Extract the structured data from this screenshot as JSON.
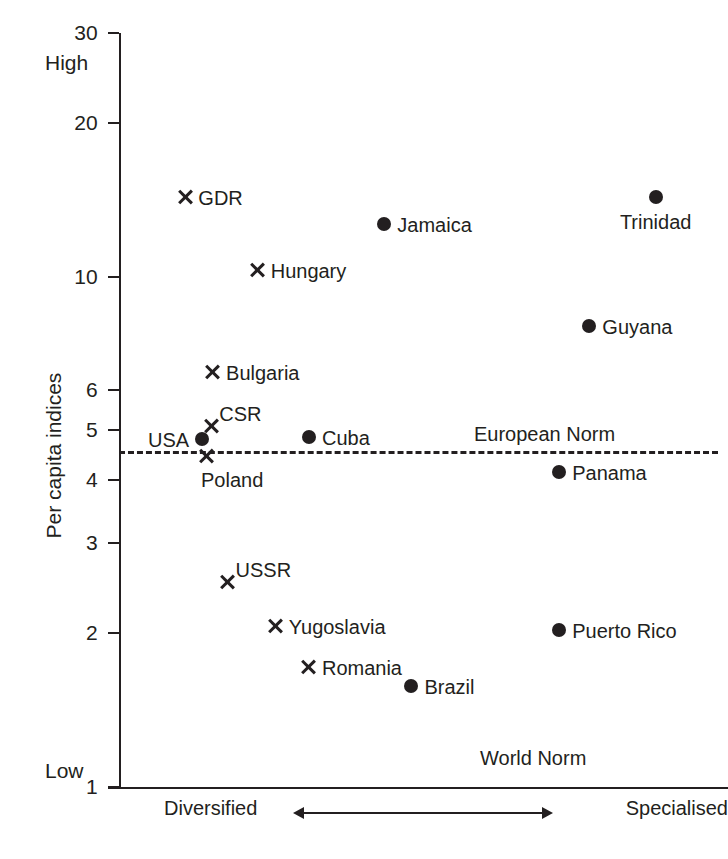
{
  "chart_data": {
    "type": "scatter",
    "title": "",
    "xlabel": "",
    "ylabel": "Per capita indices",
    "yscale": "log",
    "ylim": [
      1,
      30
    ],
    "ytick_labels": [
      "30",
      "20",
      "10",
      "6",
      "5",
      "4",
      "3",
      "2",
      "1"
    ],
    "ytick_values": [
      30,
      20,
      10,
      6,
      5,
      4,
      3,
      2,
      1
    ],
    "y_high_label": "High",
    "y_low_label": "Low",
    "x_axis_left_label": "Diversified",
    "x_axis_right_label": "Specialised",
    "x_axis_arrow": "double-headed-arrow",
    "annotations": [
      {
        "text": "European Norm",
        "y": 4.55,
        "kind": "dashed-reference-line"
      },
      {
        "text": "World Norm",
        "y": 1.0,
        "kind": "baseline-label"
      }
    ],
    "legend": [],
    "grid": false,
    "series": [
      {
        "name": "Socialist countries",
        "marker": "cross",
        "points": [
          {
            "label": "GDR",
            "x": 11.0,
            "y": 14.3,
            "label_pos": "right"
          },
          {
            "label": "Hungary",
            "x": 23.0,
            "y": 10.3,
            "label_pos": "right"
          },
          {
            "label": "Bulgaria",
            "x": 15.6,
            "y": 6.5,
            "label_pos": "right"
          },
          {
            "label": "CSR",
            "x": 15.3,
            "y": 5.1,
            "label_pos": "upright"
          },
          {
            "label": "Poland",
            "x": 14.6,
            "y": 4.45,
            "label_pos": "below"
          },
          {
            "label": "USSR",
            "x": 18.0,
            "y": 2.52,
            "label_pos": "upright"
          },
          {
            "label": "Yugoslavia",
            "x": 26.0,
            "y": 2.07,
            "label_pos": "right"
          },
          {
            "label": "Romania",
            "x": 31.5,
            "y": 1.72,
            "label_pos": "right"
          }
        ]
      },
      {
        "name": "Market countries",
        "marker": "dot",
        "points": [
          {
            "label": "Trinidad",
            "x": 89.0,
            "y": 14.3,
            "label_pos": "below-center"
          },
          {
            "label": "Jamaica",
            "x": 44.0,
            "y": 12.7,
            "label_pos": "right"
          },
          {
            "label": "Guyana",
            "x": 78.0,
            "y": 8.0,
            "label_pos": "right"
          },
          {
            "label": "Cuba",
            "x": 31.5,
            "y": 4.85,
            "label_pos": "right"
          },
          {
            "label": "USA",
            "x": 13.8,
            "y": 4.8,
            "label_pos": "left"
          },
          {
            "label": "Panama",
            "x": 73.0,
            "y": 4.15,
            "label_pos": "right"
          },
          {
            "label": "Puerto Rico",
            "x": 73.0,
            "y": 2.03,
            "label_pos": "right"
          },
          {
            "label": "Brazil",
            "x": 48.5,
            "y": 1.58,
            "label_pos": "right"
          }
        ]
      }
    ]
  },
  "colors": {
    "ink": "#231f20",
    "background": "#ffffff"
  }
}
